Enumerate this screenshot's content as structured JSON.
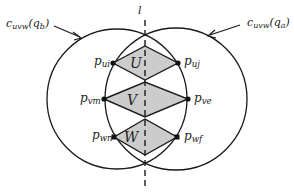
{
  "diagram": {
    "type": "geometric-figure",
    "line_label": "l",
    "circles": [
      {
        "id": "left",
        "label_main": "c",
        "label_sub": "uvw",
        "label_arg": "(q",
        "label_arg_sub": "b",
        "label_close": ")",
        "cx": 117,
        "cy": 99,
        "r": 70
      },
      {
        "id": "right",
        "label_main": "c",
        "label_sub": "uvw",
        "label_arg": "(q",
        "label_arg_sub": "a",
        "label_close": ")",
        "cx": 176,
        "cy": 99,
        "r": 71
      }
    ],
    "regions": [
      {
        "label": "U"
      },
      {
        "label": "V"
      },
      {
        "label": "W"
      }
    ],
    "points": [
      {
        "main": "p",
        "sub": "ui"
      },
      {
        "main": "p",
        "sub": "uj"
      },
      {
        "main": "p",
        "sub": "vm"
      },
      {
        "main": "p",
        "sub": "ve"
      },
      {
        "main": "p",
        "sub": "wn"
      },
      {
        "main": "p",
        "sub": "wf"
      }
    ],
    "colors": {
      "stroke": "#1a1a1a",
      "fill": "#cccccc",
      "background": "#ffffff"
    }
  }
}
